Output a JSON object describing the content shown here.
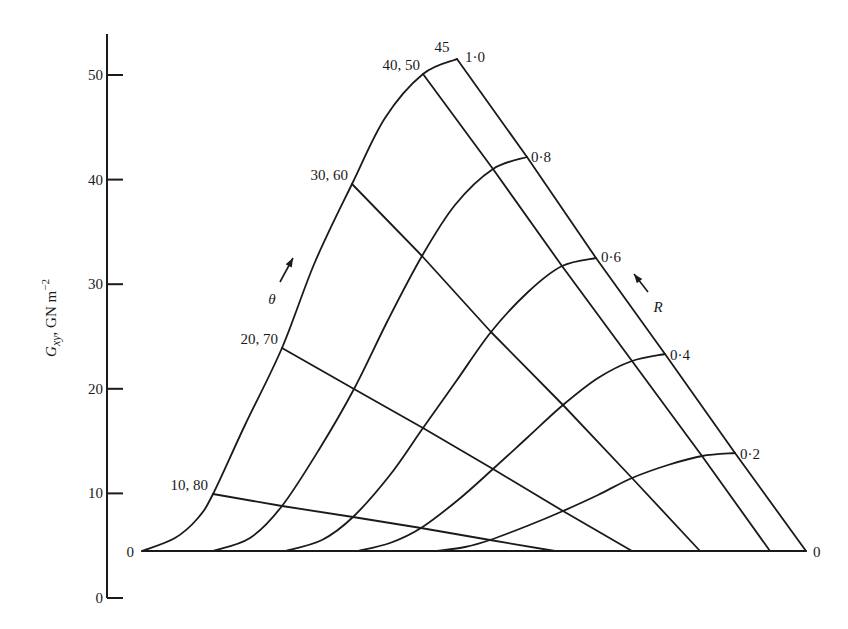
{
  "chart_data": {
    "type": "line",
    "subtype": "carpet-plot",
    "title": "",
    "ylabel": "G_xy, GN m^-2",
    "ylabel_parts": {
      "symbol": "G",
      "subscript": "xy",
      "unit": ", GN m",
      "unit_exp": "−2"
    },
    "xlabel": "",
    "ylim": [
      0,
      53
    ],
    "yticks": [
      0,
      10,
      20,
      30,
      40,
      50
    ],
    "baseline_label_left": "0",
    "baseline_label_right": "0",
    "baseline_value": 4.5,
    "theta_label": "θ",
    "R_label": "R",
    "theta_lines": [
      {
        "name": "10, 80",
        "points": [
          [
            213,
            494
          ],
          [
            282,
            506
          ],
          [
            353,
            517
          ],
          [
            421,
            528
          ],
          [
            490,
            540
          ],
          [
            555,
            551
          ]
        ]
      },
      {
        "name": "20, 70",
        "points": [
          [
            282,
            348
          ],
          [
            354,
            389
          ],
          [
            423,
            428
          ],
          [
            493,
            469
          ],
          [
            563,
            511
          ],
          [
            632,
            551
          ]
        ]
      },
      {
        "name": "30, 60",
        "points": [
          [
            352,
            184
          ],
          [
            422,
            256
          ],
          [
            491,
            332
          ],
          [
            563,
            405
          ],
          [
            632,
            478
          ],
          [
            700,
            551
          ]
        ]
      },
      {
        "name": "40, 50",
        "points": [
          [
            423,
            74
          ],
          [
            493,
            169
          ],
          [
            562,
            266
          ],
          [
            632,
            361
          ],
          [
            702,
            456
          ],
          [
            770,
            551
          ]
        ]
      },
      {
        "name": "45",
        "points": [
          [
            457,
            59
          ],
          [
            527,
            157
          ],
          [
            596,
            258
          ],
          [
            665,
            354
          ],
          [
            735,
            453
          ],
          [
            806,
            551
          ]
        ]
      }
    ],
    "R_curves": [
      {
        "name": "1·0",
        "points": [
          [
            142,
            551
          ],
          [
            175,
            538
          ],
          [
            198,
            518
          ],
          [
            213,
            494
          ],
          [
            245,
            425
          ],
          [
            282,
            348
          ],
          [
            315,
            262
          ],
          [
            352,
            184
          ],
          [
            385,
            118
          ],
          [
            423,
            74
          ],
          [
            457,
            59
          ]
        ]
      },
      {
        "name": "0·8",
        "points": [
          [
            213,
            551
          ],
          [
            250,
            538
          ],
          [
            282,
            506
          ],
          [
            320,
            448
          ],
          [
            354,
            389
          ],
          [
            388,
            320
          ],
          [
            422,
            256
          ],
          [
            455,
            205
          ],
          [
            493,
            169
          ],
          [
            527,
            157
          ]
        ]
      },
      {
        "name": "0·6",
        "points": [
          [
            285,
            551
          ],
          [
            322,
            540
          ],
          [
            353,
            517
          ],
          [
            390,
            475
          ],
          [
            423,
            428
          ],
          [
            457,
            380
          ],
          [
            491,
            332
          ],
          [
            528,
            292
          ],
          [
            562,
            266
          ],
          [
            596,
            258
          ]
        ]
      },
      {
        "name": "0·4",
        "points": [
          [
            358,
            551
          ],
          [
            390,
            543
          ],
          [
            421,
            528
          ],
          [
            458,
            500
          ],
          [
            493,
            469
          ],
          [
            528,
            437
          ],
          [
            563,
            405
          ],
          [
            598,
            378
          ],
          [
            632,
            361
          ],
          [
            665,
            354
          ]
        ]
      },
      {
        "name": "0·2",
        "points": [
          [
            437,
            551
          ],
          [
            465,
            547
          ],
          [
            490,
            540
          ],
          [
            527,
            526
          ],
          [
            563,
            511
          ],
          [
            598,
            495
          ],
          [
            632,
            478
          ],
          [
            668,
            465
          ],
          [
            702,
            456
          ],
          [
            735,
            453
          ]
        ]
      },
      {
        "name": "0",
        "points": [
          [
            142,
            551
          ],
          [
            806,
            551
          ]
        ]
      }
    ],
    "point_labels": [
      {
        "text": "10, 80",
        "x": 208,
        "y": 490,
        "anchor": "end"
      },
      {
        "text": "20, 70",
        "x": 278,
        "y": 344,
        "anchor": "end"
      },
      {
        "text": "30, 60",
        "x": 348,
        "y": 180,
        "anchor": "end"
      },
      {
        "text": "40, 50",
        "x": 420,
        "y": 70,
        "anchor": "end"
      },
      {
        "text": "45",
        "x": 442,
        "y": 52,
        "anchor": "middle"
      },
      {
        "text": "1·0",
        "x": 465,
        "y": 62,
        "anchor": "start"
      },
      {
        "text": "0·8",
        "x": 531,
        "y": 162,
        "anchor": "start"
      },
      {
        "text": "0·6",
        "x": 601,
        "y": 262,
        "anchor": "start"
      },
      {
        "text": "0·4",
        "x": 670,
        "y": 360,
        "anchor": "start"
      },
      {
        "text": "0·2",
        "x": 740,
        "y": 459,
        "anchor": "start"
      }
    ],
    "layout": {
      "axis_x": 107,
      "axis_top": 34,
      "axis_bottom": 598,
      "y0_px": 598,
      "px_per_unit": 10.46,
      "grid": false,
      "legend": "none"
    }
  }
}
